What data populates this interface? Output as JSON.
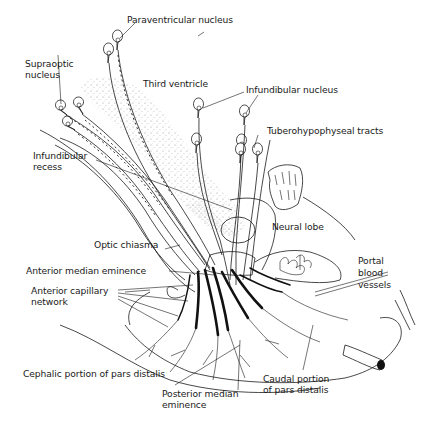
{
  "figure": {
    "colors": {
      "ink": "#1a1a1a",
      "background": "#ffffff",
      "stipple": "#8a8a8a"
    }
  },
  "labels": {
    "paraventricular_nucleus": "Paraventricular nucleus",
    "supraoptic_nucleus": "Supraoptic\nnucleus",
    "third_ventricle": "Third ventricle",
    "infundibular_nucleus": "Infundibular nucleus",
    "tuberohypophyseal_tracts": "Tuberohypophyseal tracts",
    "infundibular_recess": "Infundibular\nrecess",
    "neural_lobe": "Neural lobe",
    "optic_chiasma": "Optic chiasma",
    "portal_blood_vessels": "Portal\nblood\nvessels",
    "anterior_median_eminence": "Anterior median eminence",
    "anterior_capillary_network": "Anterior capillary\nnetwork",
    "cephalic_portion": "Cephalic portion of pars distalis",
    "caudal_portion": "Caudal portion\nof pars distalis",
    "posterior_median_eminence": "Posterior median\neminence"
  }
}
